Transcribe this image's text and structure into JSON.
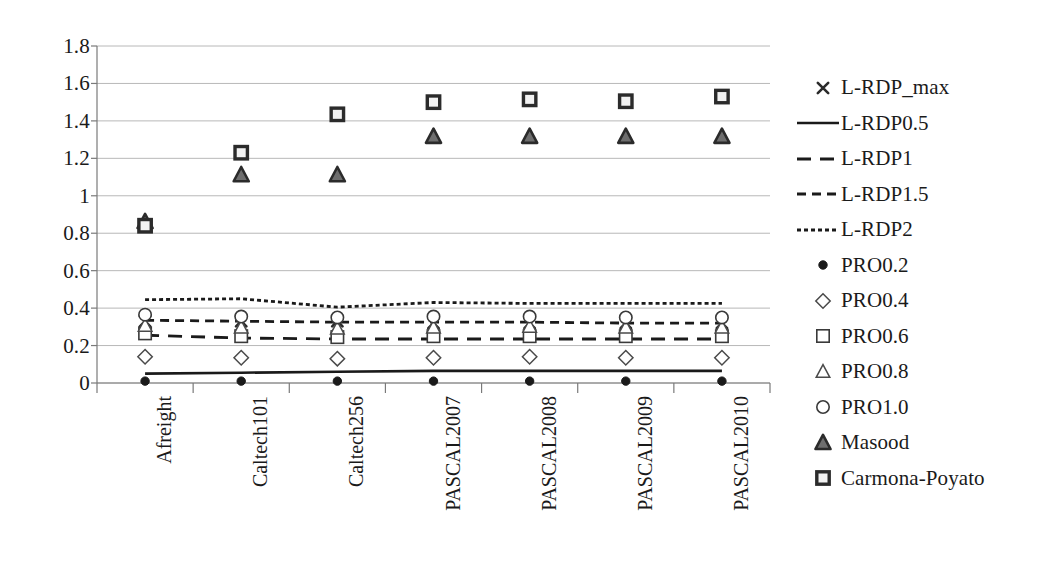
{
  "chart_data": {
    "type": "scatter",
    "title": "",
    "xlabel": "",
    "ylabel": "",
    "ylim": [
      0,
      1.8
    ],
    "yticks": [
      "0",
      "0.2",
      "0.4",
      "0.6",
      "0.8",
      "1",
      "1.2",
      "1.4",
      "1.6",
      "1.8"
    ],
    "ytick_values": [
      0,
      0.2,
      0.4,
      0.6,
      0.8,
      1.0,
      1.2,
      1.4,
      1.6,
      1.8
    ],
    "grid": true,
    "legend_position": "right",
    "categories": [
      "Afreight",
      "Caltech101",
      "Caltech256",
      "PASCAL2007",
      "PASCAL2008",
      "PASCAL2009",
      "PASCAL2010"
    ],
    "series": [
      {
        "name": "L-RDP_max",
        "marker": "cross",
        "render": "markers",
        "color": "#2b2b2b",
        "values": [
          0.33,
          0.33,
          0.33,
          0.32,
          0.32,
          0.32,
          0.32
        ]
      },
      {
        "name": "L-RDP0.5",
        "marker": "none",
        "render": "line",
        "dash": "solid",
        "color": "#1a1a1a",
        "values": [
          0.05,
          0.055,
          0.06,
          0.065,
          0.065,
          0.065,
          0.065
        ]
      },
      {
        "name": "L-RDP1",
        "marker": "none",
        "render": "line",
        "dash": "long-dash",
        "color": "#1a1a1a",
        "values": [
          0.255,
          0.24,
          0.235,
          0.235,
          0.235,
          0.235,
          0.235
        ]
      },
      {
        "name": "L-RDP1.5",
        "marker": "none",
        "render": "line",
        "dash": "medium-dash",
        "color": "#1a1a1a",
        "values": [
          0.335,
          0.33,
          0.325,
          0.325,
          0.325,
          0.32,
          0.32
        ]
      },
      {
        "name": "L-RDP2",
        "marker": "none",
        "render": "line",
        "dash": "fine-dash",
        "color": "#1a1a1a",
        "values": [
          0.445,
          0.45,
          0.405,
          0.43,
          0.425,
          0.425,
          0.425
        ]
      },
      {
        "name": "PRO0.2",
        "marker": "filled-circle",
        "render": "markers",
        "color": "#1a1a1a",
        "values": [
          0.01,
          0.01,
          0.01,
          0.01,
          0.01,
          0.01,
          0.01
        ]
      },
      {
        "name": "PRO0.4",
        "marker": "open-diamond",
        "render": "markers",
        "color": "#4a4a4a",
        "values": [
          0.14,
          0.135,
          0.13,
          0.135,
          0.14,
          0.135,
          0.135
        ]
      },
      {
        "name": "PRO0.6",
        "marker": "open-square",
        "render": "markers",
        "color": "#3a3a3a",
        "values": [
          0.265,
          0.25,
          0.245,
          0.25,
          0.25,
          0.25,
          0.25
        ]
      },
      {
        "name": "PRO0.8",
        "marker": "open-triangle",
        "render": "markers",
        "color": "#4a4a4a",
        "values": [
          0.305,
          0.295,
          0.29,
          0.295,
          0.3,
          0.295,
          0.295
        ]
      },
      {
        "name": "PRO1.0",
        "marker": "open-circle",
        "render": "markers",
        "color": "#3a3a3a",
        "values": [
          0.365,
          0.355,
          0.35,
          0.355,
          0.355,
          0.35,
          0.35
        ]
      },
      {
        "name": "Masood",
        "marker": "filled-triangle",
        "render": "markers",
        "color": "#2b2b2b",
        "values": [
          0.86,
          1.11,
          1.11,
          1.315,
          1.315,
          1.315,
          1.315
        ]
      },
      {
        "name": "Carmona-Poyato",
        "marker": "filled-square",
        "render": "markers",
        "color": "#2b2b2b",
        "values": [
          0.84,
          1.23,
          1.435,
          1.5,
          1.515,
          1.505,
          1.53
        ]
      }
    ]
  },
  "legend": {
    "entries": [
      {
        "label": "L-RDP_max",
        "key": "cross"
      },
      {
        "label": "L-RDP0.5",
        "key": "solid-line"
      },
      {
        "label": "L-RDP1",
        "key": "long-dash-line"
      },
      {
        "label": "L-RDP1.5",
        "key": "medium-dash-line"
      },
      {
        "label": "L-RDP2",
        "key": "fine-dash-line"
      },
      {
        "label": "PRO0.2",
        "key": "filled-circle"
      },
      {
        "label": "PRO0.4",
        "key": "open-diamond"
      },
      {
        "label": "PRO0.6",
        "key": "open-square"
      },
      {
        "label": "PRO0.8",
        "key": "open-triangle"
      },
      {
        "label": "PRO1.0",
        "key": "open-circle"
      },
      {
        "label": "Masood",
        "key": "filled-triangle"
      },
      {
        "label": "Carmona-Poyato",
        "key": "filled-square"
      }
    ]
  },
  "colors": {
    "grid": "#b8b8b8",
    "axis": "#7a7a7a",
    "ink": "#1a1a1a",
    "background": "#ffffff"
  }
}
